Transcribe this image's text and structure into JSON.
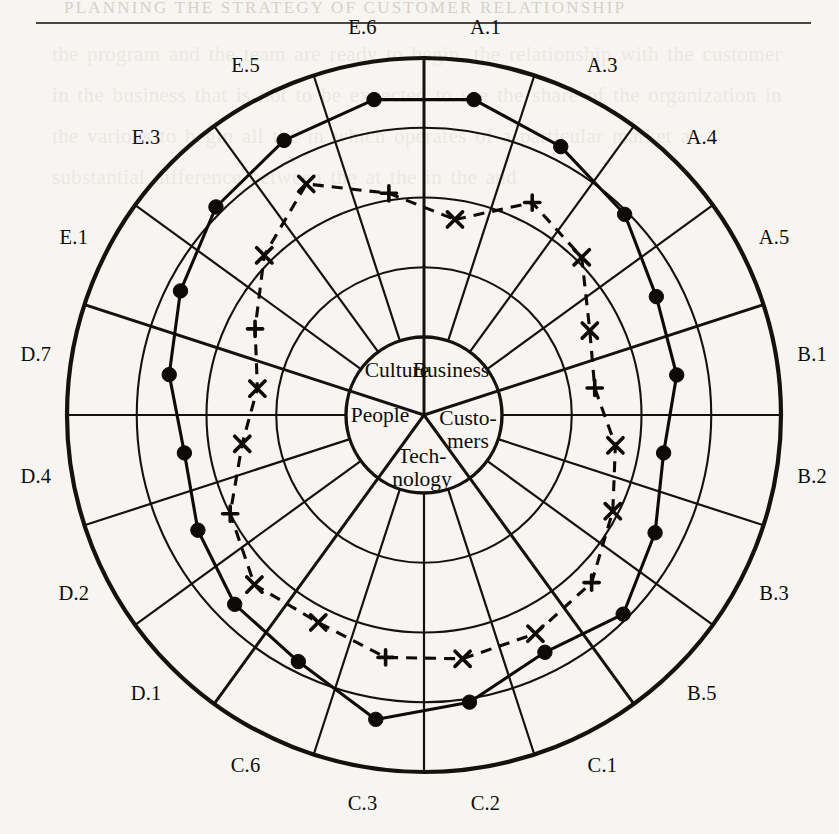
{
  "page": {
    "header_text": "PLANNING THE STRATEGY OF CUSTOMER RELATIONSHIP",
    "background_color": "#f7f5f1",
    "ink_color": "#15120e",
    "bleed_through_text": "the program and the team are ready to begin. the relationship with the customer in the business that is not to be expected to see the share of the organization in the various to begin all the in which operates of a particular market a substantial difference between the at the in the and"
  },
  "chart_data": {
    "type": "radar",
    "title": "",
    "subtitle": "",
    "xlabel": "",
    "ylabel": "",
    "grid": true,
    "legend_position": "none",
    "rlim": [
      0,
      4
    ],
    "rings": 4,
    "ring_values": [
      1,
      2,
      3,
      4
    ],
    "hub_label_ring": 0,
    "categories": [
      "A.1",
      "A.3",
      "A.4",
      "A.5",
      "B.1",
      "B.2",
      "B.3",
      "B.5",
      "C.1",
      "C.2",
      "C.3",
      "C.6",
      "D.1",
      "D.2",
      "D.4",
      "D.7",
      "E.1",
      "E.3",
      "E.5",
      "E.6"
    ],
    "groups": [
      {
        "name": "Business",
        "label": "Business",
        "axes": [
          "A.1",
          "A.3",
          "A.4",
          "A.5"
        ]
      },
      {
        "name": "Customers",
        "label": "Custo-\nmers",
        "axes": [
          "B.1",
          "B.2",
          "B.3",
          "B.5"
        ]
      },
      {
        "name": "Technology",
        "label": "Tech-\nnology",
        "axes": [
          "C.1",
          "C.2",
          "C.3",
          "C.6"
        ]
      },
      {
        "name": "People",
        "label": "People",
        "axes": [
          "D.1",
          "D.2",
          "D.4",
          "D.7"
        ]
      },
      {
        "name": "Culture",
        "label": "Culture",
        "axes": [
          "E.1",
          "E.3",
          "E.5",
          "E.6"
        ]
      }
    ],
    "series": [
      {
        "name": "current",
        "marker": "filled-circle",
        "line_style": "solid",
        "values": [
          3.46,
          3.2,
          2.95,
          2.62,
          2.55,
          2.36,
          2.6,
          2.92,
          2.7,
          3.05,
          3.3,
          2.85,
          2.72,
          2.52,
          2.36,
          2.58,
          2.8,
          3.1,
          3.3,
          3.46
        ]
      },
      {
        "name": "target",
        "marker": "cross",
        "line_style": "dashed",
        "values": [
          1.72,
          2.3,
          2.08,
          1.55,
          1.36,
          1.66,
          1.92,
          2.28,
          2.4,
          2.42,
          2.4,
          2.22,
          2.32,
          2.0,
          1.52,
          1.3,
          1.6,
          2.12,
          2.6,
          2.1
        ]
      }
    ]
  },
  "axis_labels": {
    "A.1": "A.1",
    "A.3": "A.3",
    "A.4": "A.4",
    "A.5": "A.5",
    "B.1": "B.1",
    "B.2": "B.2",
    "B.3": "B.3",
    "B.5": "B.5",
    "C.1": "C.1",
    "C.2": "C.2",
    "C.3": "C.3",
    "C.6": "C.6",
    "D.1": "D.1",
    "D.2": "D.2",
    "D.4": "D.4",
    "D.7": "D.7",
    "E.1": "E.1",
    "E.3": "E.3",
    "E.5": "E.5",
    "E.6": "E.6"
  },
  "hub": {
    "business": "Business",
    "customers_line1": "Custo-",
    "customers_line2": "mers",
    "technology_line1": "Tech-",
    "technology_line2": "nology",
    "people": "People",
    "culture": "Culture"
  },
  "geometry": {
    "center_x": 424,
    "center_y": 415,
    "outer_radius": 357,
    "hub_radius": 78,
    "label_radius": 393
  }
}
